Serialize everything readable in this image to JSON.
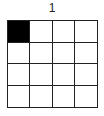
{
  "puzzle": {
    "label": "1",
    "rows": 4,
    "cols": 4,
    "cells": [
      [
        1,
        0,
        0,
        0
      ],
      [
        0,
        0,
        0,
        0
      ],
      [
        0,
        0,
        0,
        0
      ],
      [
        0,
        0,
        0,
        0
      ]
    ],
    "colors": {
      "filled": "#000000",
      "empty": "#ffffff",
      "line": "#222222"
    }
  }
}
